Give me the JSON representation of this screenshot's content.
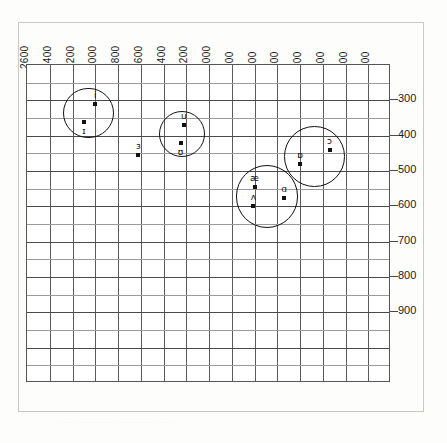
{
  "figure": {
    "title": "",
    "x_axis_label": "",
    "y_axis_label": ""
  },
  "chart_data": {
    "type": "scatter",
    "title": "",
    "xlabel": "F2 (Hz)",
    "ylabel": "F1 (Hz)",
    "x_reversed": true,
    "y_reversed": true,
    "grid": true,
    "legend": "none",
    "xticks": [
      2600,
      2400,
      2200,
      2000,
      1800,
      1600,
      1400,
      1200,
      1000,
      900,
      800,
      700,
      600,
      500,
      400,
      300
    ],
    "xtick_labels": [
      "2600",
      "2400",
      "2200",
      "2000",
      "1800",
      "1600",
      "1400",
      "1200",
      "1000",
      "900",
      "800",
      "700",
      "600",
      "500",
      "400",
      "300"
    ],
    "yticks": [
      300,
      400,
      500,
      600,
      700,
      800,
      900
    ],
    "ytick_labels": [
      "300",
      "400",
      "500",
      "600",
      "700",
      "800",
      "900"
    ],
    "ylim": [
      200,
      1000
    ],
    "points": [
      {
        "label": "i",
        "x": 2000,
        "y": 310,
        "label_pos": "above"
      },
      {
        "label": "ɪ",
        "x": 2100,
        "y": 360,
        "label_pos": "below"
      },
      {
        "label": "u",
        "x": 1220,
        "y": 370,
        "label_pos": "above"
      },
      {
        "label": "ʊ",
        "x": 1250,
        "y": 420,
        "label_pos": "below"
      },
      {
        "label": "ɜ",
        "x": 1620,
        "y": 455,
        "label_pos": "above"
      },
      {
        "label": "ɔ",
        "x": 470,
        "y": 440,
        "label_pos": "above"
      },
      {
        "label": "ɒ",
        "x": 600,
        "y": 480,
        "label_pos": "above"
      },
      {
        "label": "æ",
        "x": 800,
        "y": 545,
        "label_pos": "above"
      },
      {
        "label": "ɑ",
        "x": 670,
        "y": 575,
        "label_pos": "above"
      },
      {
        "label": "ʌ",
        "x": 805,
        "y": 600,
        "label_pos": "above"
      }
    ],
    "groups": [
      {
        "name": "front-close-group",
        "members": [
          "i",
          "ɪ"
        ],
        "cx": 2060,
        "cy": 335
      },
      {
        "name": "back-close-group",
        "members": [
          "u",
          "ʊ"
        ],
        "cx": 1235,
        "cy": 395
      },
      {
        "name": "back-open-mid-group",
        "members": [
          "ɔ",
          "ɒ"
        ],
        "cx": 535,
        "cy": 460
      },
      {
        "name": "open-group",
        "members": [
          "æ",
          "ɑ",
          "ʌ"
        ],
        "cx": 745,
        "cy": 572
      }
    ]
  }
}
